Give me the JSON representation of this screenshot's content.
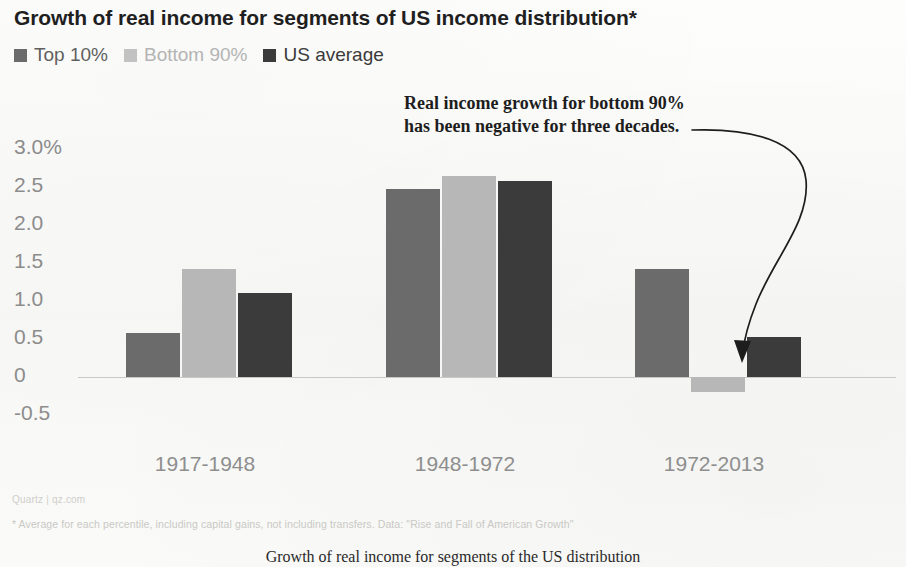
{
  "chart_data": {
    "type": "bar",
    "title": "Growth of real income for segments of US income distribution*",
    "xlabel": "",
    "ylabel": "",
    "categories": [
      "1917-1948",
      "1948-1972",
      "1972-2013"
    ],
    "series": [
      {
        "name": "Top 10%",
        "color": "#6b6b6b",
        "values": [
          0.58,
          2.47,
          1.42
        ]
      },
      {
        "name": "Bottom 90%",
        "color": "#b7b7b7",
        "values": [
          1.42,
          2.65,
          -0.2
        ]
      },
      {
        "name": "US average",
        "color": "#3b3b3b",
        "values": [
          1.11,
          2.58,
          0.52
        ]
      }
    ],
    "ytick_labels": [
      "3.0%",
      "2.5",
      "2.0",
      "1.5",
      "1.0",
      "0.5",
      "0",
      "-0.5"
    ],
    "ytick_values": [
      3.0,
      2.5,
      2.0,
      1.5,
      1.0,
      0.5,
      0,
      -0.5
    ],
    "ylim": [
      -0.5,
      3.0
    ],
    "grid": false,
    "zero_line": true,
    "legend_position": "top-left",
    "annotations": [
      {
        "text_line_1": "Real income growth for bottom 90%",
        "text_line_2": "has been negative for three decades.",
        "points_to": "1972-2013 Bottom 90% bar"
      }
    ]
  },
  "legend": {
    "items": [
      {
        "label": "Top 10%",
        "color": "#6b6b6b"
      },
      {
        "label": "Bottom 90%",
        "color": "#b7b7b7"
      },
      {
        "label": "US average",
        "color": "#3b3b3b"
      }
    ]
  },
  "footer": {
    "source": "Quartz | qz.com",
    "note": "* Average for each percentile, including capital gains, not including transfers. Data: \"Rise and Fall of American Growth\""
  },
  "caption": "Growth of real income for segments of the US distribution"
}
